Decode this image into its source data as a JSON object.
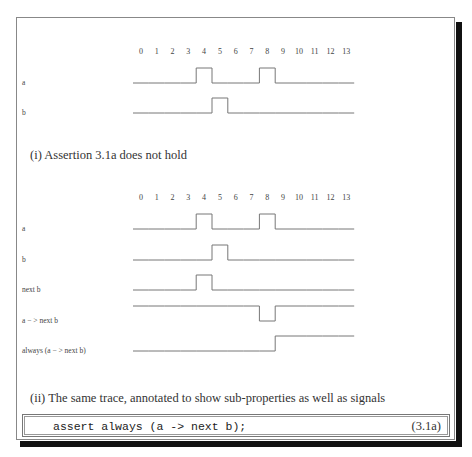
{
  "chart_data": [
    {
      "type": "timing-diagram",
      "id": "panel-i",
      "caption": "(i) Assertion 3.1a does not hold",
      "time_ticks": [
        "0",
        "1",
        "2",
        "3",
        "4",
        "5",
        "6",
        "7",
        "8",
        "9",
        "10",
        "11",
        "12",
        "13"
      ],
      "signals": [
        {
          "name": "a",
          "values": [
            0,
            0,
            0,
            0,
            1,
            0,
            0,
            0,
            1,
            0,
            0,
            0,
            0,
            0
          ]
        },
        {
          "name": "b",
          "values": [
            0,
            0,
            0,
            0,
            0,
            1,
            0,
            0,
            0,
            0,
            0,
            0,
            0,
            0
          ]
        }
      ]
    },
    {
      "type": "timing-diagram",
      "id": "panel-ii",
      "caption": "(ii) The same trace, annotated to show sub-properties as well as signals",
      "time_ticks": [
        "0",
        "1",
        "2",
        "3",
        "4",
        "5",
        "6",
        "7",
        "8",
        "9",
        "10",
        "11",
        "12",
        "13"
      ],
      "signals": [
        {
          "name": "a",
          "values": [
            0,
            0,
            0,
            0,
            1,
            0,
            0,
            0,
            1,
            0,
            0,
            0,
            0,
            0
          ]
        },
        {
          "name": "b",
          "values": [
            0,
            0,
            0,
            0,
            0,
            1,
            0,
            0,
            0,
            0,
            0,
            0,
            0,
            0
          ]
        },
        {
          "name": "next b",
          "values": [
            0,
            0,
            0,
            0,
            1,
            0,
            0,
            0,
            0,
            0,
            0,
            0,
            0,
            0
          ]
        },
        {
          "name": "a − > next b",
          "values": [
            1,
            1,
            1,
            1,
            1,
            1,
            1,
            1,
            0,
            1,
            1,
            1,
            1,
            1
          ]
        },
        {
          "name": "always (a − > next b)",
          "values": [
            0,
            0,
            0,
            0,
            0,
            0,
            0,
            0,
            0,
            1,
            1,
            1,
            1,
            1
          ]
        }
      ]
    }
  ],
  "code": {
    "text": "assert always (a -> next b);",
    "equation_number": "(3.1a)"
  }
}
